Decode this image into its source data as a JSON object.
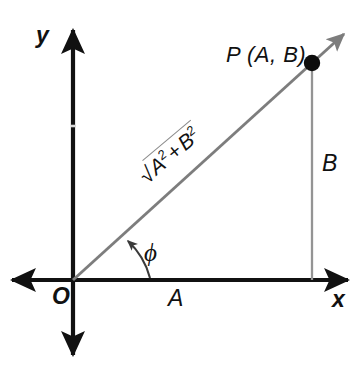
{
  "figure": {
    "type": "coordinate-diagram",
    "background_color": "#ffffff",
    "axis_color": "#111111",
    "ray_color": "#7a7a7a",
    "drop_line_color": "#8f8f8f",
    "label_color": "#111111"
  },
  "labels": {
    "y_axis": "y",
    "x_axis": "x",
    "origin": "O",
    "point": "P (A, B)",
    "adjacent_leg": "A",
    "opposite_leg": "B",
    "angle": "ϕ",
    "hypotenuse_radical_sign": "√",
    "hypotenuse_first_term": "A",
    "hypotenuse_first_exponent": "2",
    "hypotenuse_operator": "+",
    "hypotenuse_second_term": "B",
    "hypotenuse_second_exponent": "2"
  },
  "geometry": {
    "origin": {
      "x": 73,
      "y": 280
    },
    "point_p": {
      "x": 312,
      "y": 63
    },
    "x_axis": {
      "x1": 10,
      "y1": 280,
      "x2": 350,
      "y2": 280
    },
    "y_axis": {
      "x1": 73,
      "y1": 28,
      "x2": 73,
      "y2": 357
    },
    "ray_tip": {
      "x": 348,
      "y": 30
    },
    "angle_degrees": 42,
    "arc_radius": 76
  }
}
